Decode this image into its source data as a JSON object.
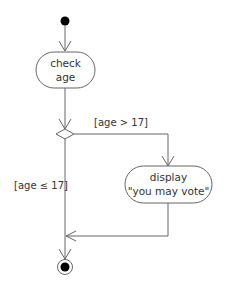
{
  "diagram": {
    "type": "uml-activity",
    "nodes": {
      "start": {
        "kind": "initial"
      },
      "check_age": {
        "kind": "action",
        "line1": "check",
        "line2": "age"
      },
      "decision": {
        "kind": "decision"
      },
      "display": {
        "kind": "action",
        "line1": "display",
        "line2": "\"you may vote\""
      },
      "end": {
        "kind": "final"
      }
    },
    "guards": {
      "yes": "[age > 17]",
      "no": "[age ≤ 17]"
    },
    "colors": {
      "stroke": "#555555",
      "fill": "#ffffff",
      "dot": "#000000"
    }
  }
}
